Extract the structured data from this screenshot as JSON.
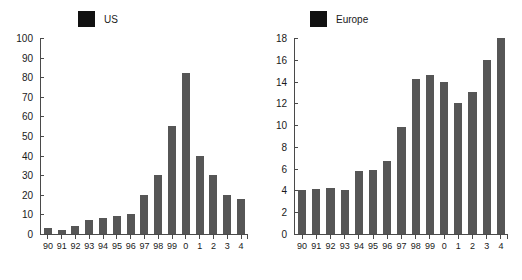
{
  "chart_data": [
    {
      "type": "bar",
      "title": "US",
      "legend_label": "US",
      "legend_position": "top-left-inside",
      "xlabel": "",
      "ylabel": "",
      "categories": [
        "90",
        "91",
        "92",
        "93",
        "94",
        "95",
        "96",
        "97",
        "98",
        "99",
        "0",
        "1",
        "2",
        "3",
        "4"
      ],
      "values": [
        3,
        2,
        4,
        7,
        8,
        9,
        10,
        20,
        30,
        55,
        82,
        40,
        30,
        20,
        18
      ],
      "ylim": [
        0,
        100
      ],
      "yticks": [
        0,
        10,
        20,
        30,
        40,
        50,
        60,
        70,
        80,
        90,
        100
      ],
      "ytick_labels": [
        "0",
        "10",
        "20",
        "30",
        "40",
        "50",
        "60",
        "70",
        "80",
        "90",
        "100"
      ],
      "grid": false,
      "bar_color": "#565656",
      "axis_color": "#4a4a4a"
    },
    {
      "type": "bar",
      "title": "Europe",
      "legend_label": "Europe",
      "legend_position": "top-left-inside",
      "xlabel": "",
      "ylabel": "",
      "categories": [
        "90",
        "91",
        "92",
        "93",
        "94",
        "95",
        "96",
        "97",
        "98",
        "99",
        "0",
        "1",
        "2",
        "3",
        "4"
      ],
      "values": [
        4.0,
        4.1,
        4.2,
        4.0,
        5.8,
        5.9,
        6.7,
        9.8,
        14.2,
        14.6,
        14.0,
        12.0,
        13.0,
        16.0,
        18.0
      ],
      "ylim": [
        0,
        18
      ],
      "yticks": [
        0,
        2,
        4,
        6,
        8,
        10,
        12,
        14,
        16,
        18
      ],
      "ytick_labels": [
        "0",
        "2",
        "4",
        "6",
        "8",
        "10",
        "12",
        "14",
        "16",
        "18"
      ],
      "grid": false,
      "bar_color": "#565656",
      "axis_color": "#4a4a4a"
    }
  ],
  "panels": {
    "left": {
      "legend_label": "US"
    },
    "right": {
      "legend_label": "Europe"
    }
  }
}
